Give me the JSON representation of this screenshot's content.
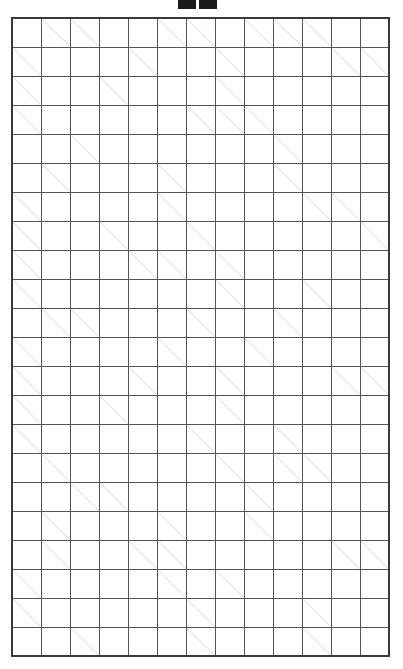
{
  "puzzle": {
    "type": "kakuro",
    "rows": 22,
    "cols": 13,
    "title_marks": [
      "mark-a",
      "mark-b"
    ],
    "colors": {
      "block": "#121212",
      "cell": "#ffffff",
      "grid_line": "#555555",
      "border": "#3a3a3a",
      "clue_text": "#ffffff",
      "diagonal": "#e8e8e8"
    },
    "grid": [
      [
        {
          "t": "block"
        },
        {
          "t": "clue",
          "down": "11"
        },
        {
          "t": "clue",
          "down": "20"
        },
        {
          "t": "block"
        },
        {
          "t": "block"
        },
        {
          "t": "clue",
          "down": "14"
        },
        {
          "t": "clue",
          "down": "4"
        },
        {
          "t": "block"
        },
        {
          "t": "clue",
          "down": "4"
        },
        {
          "t": "clue",
          "down": "18"
        },
        {
          "t": "clue",
          "down": "34"
        },
        {
          "t": "block"
        },
        {
          "t": "block"
        }
      ],
      [
        {
          "t": "clue",
          "across": "17"
        },
        {
          "t": "open"
        },
        {
          "t": "open"
        },
        {
          "t": "block"
        },
        {
          "t": "clue",
          "across": "4",
          "down": "20"
        },
        {
          "t": "open"
        },
        {
          "t": "open"
        },
        {
          "t": "clue",
          "across": "20"
        },
        {
          "t": "open"
        },
        {
          "t": "open"
        },
        {
          "t": "open"
        },
        {
          "t": "clue",
          "down": "13"
        },
        {
          "t": "clue",
          "down": "16"
        }
      ],
      [
        {
          "t": "clue",
          "across": "4"
        },
        {
          "t": "open"
        },
        {
          "t": "open"
        },
        {
          "t": "clue",
          "across": "20",
          "down": "29"
        },
        {
          "t": "open"
        },
        {
          "t": "open"
        },
        {
          "t": "open"
        },
        {
          "t": "clue",
          "across": "25"
        },
        {
          "t": "open"
        },
        {
          "t": "open"
        },
        {
          "t": "open"
        },
        {
          "t": "open"
        },
        {
          "t": "open"
        }
      ],
      [
        {
          "t": "clue",
          "across": "21"
        },
        {
          "t": "open"
        },
        {
          "t": "open"
        },
        {
          "t": "open"
        },
        {
          "t": "open"
        },
        {
          "t": "open"
        },
        {
          "t": "clue",
          "down": "23"
        },
        {
          "t": "clue",
          "down": "21"
        },
        {
          "t": "clue",
          "across": "15"
        },
        {
          "t": "open"
        },
        {
          "t": "open"
        },
        {
          "t": "open"
        },
        {
          "t": "open"
        }
      ],
      [
        {
          "t": "block"
        },
        {
          "t": "block"
        },
        {
          "t": "clue",
          "across": "18",
          "down": "32"
        },
        {
          "t": "open"
        },
        {
          "t": "open"
        },
        {
          "t": "open"
        },
        {
          "t": "open"
        },
        {
          "t": "open"
        },
        {
          "t": "block"
        },
        {
          "t": "clue",
          "across": "16",
          "down": "16"
        },
        {
          "t": "open"
        },
        {
          "t": "open"
        },
        {
          "t": "block"
        }
      ],
      [
        {
          "t": "block"
        },
        {
          "t": "clue",
          "across": "15",
          "down": "12"
        },
        {
          "t": "open"
        },
        {
          "t": "open"
        },
        {
          "t": "open"
        },
        {
          "t": "clue",
          "across": "16"
        },
        {
          "t": "open"
        },
        {
          "t": "open"
        },
        {
          "t": "open"
        },
        {
          "t": "clue",
          "across": "10",
          "down": "24"
        },
        {
          "t": "open"
        },
        {
          "t": "open"
        },
        {
          "t": "block"
        }
      ],
      [
        {
          "t": "clue",
          "across": "27"
        },
        {
          "t": "open"
        },
        {
          "t": "open"
        },
        {
          "t": "open"
        },
        {
          "t": "open"
        },
        {
          "t": "clue",
          "across": "28"
        },
        {
          "t": "open"
        },
        {
          "t": "open"
        },
        {
          "t": "open"
        },
        {
          "t": "open"
        },
        {
          "t": "clue",
          "down": "13"
        },
        {
          "t": "clue",
          "down": "17"
        },
        {
          "t": "block"
        }
      ],
      [
        {
          "t": "clue",
          "across": "4"
        },
        {
          "t": "open"
        },
        {
          "t": "open"
        },
        {
          "t": "clue",
          "down": "32"
        },
        {
          "t": "block"
        },
        {
          "t": "open"
        },
        {
          "t": "clue",
          "across": "19"
        },
        {
          "t": "open"
        },
        {
          "t": "open"
        },
        {
          "t": "open"
        },
        {
          "t": "open"
        },
        {
          "t": "open"
        },
        {
          "t": "clue",
          "down": "26"
        }
      ],
      [
        {
          "t": "clue",
          "across": "18"
        },
        {
          "t": "open"
        },
        {
          "t": "open"
        },
        {
          "t": "open"
        },
        {
          "t": "clue",
          "down": "13"
        },
        {
          "t": "clue",
          "down": "16"
        },
        {
          "t": "block"
        },
        {
          "t": "clue",
          "across": "16"
        },
        {
          "t": "open"
        },
        {
          "t": "open"
        },
        {
          "t": "open"
        },
        {
          "t": "open"
        },
        {
          "t": "open"
        }
      ],
      [
        {
          "t": "clue",
          "across": "25"
        },
        {
          "t": "open"
        },
        {
          "t": "open"
        },
        {
          "t": "open"
        },
        {
          "t": "open"
        },
        {
          "t": "open"
        },
        {
          "t": "block"
        },
        {
          "t": "clue",
          "across": "14",
          "down": "15"
        },
        {
          "t": "open"
        },
        {
          "t": "open"
        },
        {
          "t": "clue",
          "across": "4",
          "down": "16"
        },
        {
          "t": "open"
        },
        {
          "t": "open"
        }
      ],
      [
        {
          "t": "block"
        },
        {
          "t": "clue",
          "down": "29"
        },
        {
          "t": "clue",
          "across": "23",
          "down": "19"
        },
        {
          "t": "open"
        },
        {
          "t": "open"
        },
        {
          "t": "open"
        },
        {
          "t": "clue",
          "across": "14",
          "down": "14"
        },
        {
          "t": "open"
        },
        {
          "t": "open"
        },
        {
          "t": "clue",
          "across": "18",
          "down": "13"
        },
        {
          "t": "open"
        },
        {
          "t": "open"
        },
        {
          "t": "open"
        }
      ],
      [
        {
          "t": "clue",
          "across": "24"
        },
        {
          "t": "open"
        },
        {
          "t": "open"
        },
        {
          "t": "open"
        },
        {
          "t": "open"
        },
        {
          "t": "clue",
          "across": "11",
          "down": "34"
        },
        {
          "t": "open"
        },
        {
          "t": "open"
        },
        {
          "t": "clue",
          "across": "24",
          "down": "4"
        },
        {
          "t": "open"
        },
        {
          "t": "open"
        },
        {
          "t": "open"
        },
        {
          "t": "open"
        }
      ],
      [
        {
          "t": "clue",
          "across": "9"
        },
        {
          "t": "open"
        },
        {
          "t": "open"
        },
        {
          "t": "open"
        },
        {
          "t": "clue",
          "across": "16",
          "down": "31"
        },
        {
          "t": "open"
        },
        {
          "t": "open"
        },
        {
          "t": "clue",
          "across": "7"
        },
        {
          "t": "open"
        },
        {
          "t": "open"
        },
        {
          "t": "open"
        },
        {
          "t": "clue",
          "down": "35"
        },
        {
          "t": "clue",
          "down": "13"
        }
      ],
      [
        {
          "t": "clue",
          "across": "16"
        },
        {
          "t": "open"
        },
        {
          "t": "open"
        },
        {
          "t": "clue",
          "across": "16",
          "down": "4"
        },
        {
          "t": "open"
        },
        {
          "t": "open"
        },
        {
          "t": "block"
        },
        {
          "t": "clue",
          "across": "20"
        },
        {
          "t": "open"
        },
        {
          "t": "open"
        },
        {
          "t": "open"
        },
        {
          "t": "open"
        },
        {
          "t": "open"
        }
      ],
      [
        {
          "t": "clue",
          "across": "26"
        },
        {
          "t": "open"
        },
        {
          "t": "open"
        },
        {
          "t": "open"
        },
        {
          "t": "open"
        },
        {
          "t": "open"
        },
        {
          "t": "clue",
          "down": "30"
        },
        {
          "t": "block"
        },
        {
          "t": "block"
        },
        {
          "t": "clue",
          "across": "9"
        },
        {
          "t": "open"
        },
        {
          "t": "open"
        },
        {
          "t": "open"
        }
      ],
      [
        {
          "t": "block"
        },
        {
          "t": "clue",
          "across": "32"
        },
        {
          "t": "open"
        },
        {
          "t": "open"
        },
        {
          "t": "open"
        },
        {
          "t": "open"
        },
        {
          "t": "open"
        },
        {
          "t": "clue",
          "down": "11"
        },
        {
          "t": "block"
        },
        {
          "t": "clue",
          "down": "35"
        },
        {
          "t": "clue",
          "across": "14",
          "down": "11"
        },
        {
          "t": "open"
        },
        {
          "t": "open"
        }
      ],
      [
        {
          "t": "block"
        },
        {
          "t": "block"
        },
        {
          "t": "clue",
          "down": "20"
        },
        {
          "t": "clue",
          "across": "13",
          "down": "23"
        },
        {
          "t": "open"
        },
        {
          "t": "open"
        },
        {
          "t": "open"
        },
        {
          "t": "open"
        },
        {
          "t": "clue",
          "across": "16"
        },
        {
          "t": "open"
        },
        {
          "t": "open"
        },
        {
          "t": "open"
        },
        {
          "t": "open"
        }
      ],
      [
        {
          "t": "block"
        },
        {
          "t": "clue",
          "across": "8"
        },
        {
          "t": "open"
        },
        {
          "t": "open"
        },
        {
          "t": "open"
        },
        {
          "t": "clue",
          "across": "16"
        },
        {
          "t": "open"
        },
        {
          "t": "open"
        },
        {
          "t": "clue",
          "across": "21",
          "down": "14"
        },
        {
          "t": "open"
        },
        {
          "t": "open"
        },
        {
          "t": "open"
        },
        {
          "t": "block"
        }
      ],
      [
        {
          "t": "block"
        },
        {
          "t": "clue",
          "across": "16",
          "down": "13"
        },
        {
          "t": "open"
        },
        {
          "t": "open"
        },
        {
          "t": "clue",
          "down": "23"
        },
        {
          "t": "clue",
          "across": "26"
        },
        {
          "t": "open"
        },
        {
          "t": "open"
        },
        {
          "t": "open"
        },
        {
          "t": "open"
        },
        {
          "t": "open"
        },
        {
          "t": "clue",
          "down": "23"
        },
        {
          "t": "clue",
          "down": "7"
        }
      ],
      [
        {
          "t": "clue",
          "across": "28"
        },
        {
          "t": "open"
        },
        {
          "t": "open"
        },
        {
          "t": "open"
        },
        {
          "t": "open"
        },
        {
          "t": "clue",
          "down": "8"
        },
        {
          "t": "block"
        },
        {
          "t": "clue",
          "across": "20",
          "down": "16"
        },
        {
          "t": "open"
        },
        {
          "t": "open"
        },
        {
          "t": "open"
        },
        {
          "t": "open"
        },
        {
          "t": "open"
        }
      ],
      [
        {
          "t": "clue",
          "across": "17"
        },
        {
          "t": "open"
        },
        {
          "t": "open"
        },
        {
          "t": "open"
        },
        {
          "t": "open"
        },
        {
          "t": "open"
        },
        {
          "t": "clue",
          "across": "15"
        },
        {
          "t": "open"
        },
        {
          "t": "open"
        },
        {
          "t": "open"
        },
        {
          "t": "clue",
          "across": "7"
        },
        {
          "t": "open"
        },
        {
          "t": "open"
        }
      ],
      [
        {
          "t": "block"
        },
        {
          "t": "block"
        },
        {
          "t": "clue",
          "across": "23"
        },
        {
          "t": "open"
        },
        {
          "t": "open"
        },
        {
          "t": "open"
        },
        {
          "t": "clue",
          "across": "16"
        },
        {
          "t": "open"
        },
        {
          "t": "open"
        },
        {
          "t": "block"
        },
        {
          "t": "clue",
          "across": "12"
        },
        {
          "t": "open"
        },
        {
          "t": "open"
        }
      ]
    ]
  }
}
